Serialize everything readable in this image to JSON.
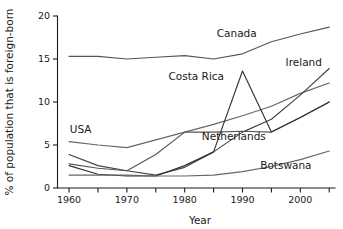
{
  "chart_data": {
    "type": "line",
    "title": "",
    "xlabel": "Year",
    "ylabel": "% of population that is foreign-born",
    "xlim": [
      1958,
      2006
    ],
    "ylim": [
      0,
      20
    ],
    "grid": false,
    "legend_position": "inline-labels",
    "x_ticks_labeled": [
      "1960",
      "1970",
      "1980",
      "1990",
      "2000"
    ],
    "x_tick_values_labeled": [
      1960,
      1970,
      1980,
      1990,
      2000
    ],
    "x_ticks_minor": [
      1965,
      1975,
      1985,
      1995,
      2005
    ],
    "y_ticks": [
      "0",
      "5",
      "10",
      "15",
      "20"
    ],
    "y_tick_values": [
      0,
      5,
      10,
      15,
      20
    ],
    "series": [
      {
        "name": "Canada",
        "label": "Canada",
        "color": "#555555",
        "x": [
          1960,
          1965,
          1970,
          1975,
          1980,
          1985,
          1990,
          1995,
          2000,
          2005
        ],
        "values": [
          15.3,
          15.3,
          15.0,
          15.2,
          15.4,
          15.0,
          15.6,
          17.0,
          17.9,
          18.7
        ]
      },
      {
        "name": "USA",
        "label": "USA",
        "color": "#666666",
        "x": [
          1960,
          1965,
          1970,
          1975,
          1980,
          1985,
          1990,
          1995,
          2000,
          2005
        ],
        "values": [
          5.4,
          5.0,
          4.7,
          5.6,
          6.5,
          7.4,
          8.4,
          9.5,
          11.0,
          12.2
        ]
      },
      {
        "name": "Ireland",
        "label": "Ireland",
        "color": "#444444",
        "x": [
          1960,
          1965,
          1970,
          1975,
          1980,
          1985,
          1990,
          1995,
          2000,
          2005
        ],
        "values": [
          3.9,
          2.6,
          2.0,
          1.5,
          2.4,
          4.2,
          6.5,
          8.0,
          10.8,
          13.9
        ]
      },
      {
        "name": "Netherlands",
        "label": "Netherlands",
        "color": "#555555",
        "x": [
          1960,
          1965,
          1970,
          1975,
          1980,
          1985,
          1990,
          1995,
          2000,
          2005
        ],
        "values": [
          2.8,
          2.3,
          2.0,
          3.9,
          6.5,
          6.5,
          6.6,
          6.5,
          8.2,
          10.0
        ]
      },
      {
        "name": "Costa Rica",
        "label": "Costa Rica",
        "color": "#333333",
        "x": [
          1960,
          1965,
          1970,
          1975,
          1980,
          1985,
          1990,
          1995,
          2000,
          2005
        ],
        "values": [
          2.6,
          1.6,
          1.4,
          1.4,
          2.6,
          4.2,
          13.6,
          6.5,
          8.2,
          10.0
        ]
      },
      {
        "name": "Botswana",
        "label": "Botswana",
        "color": "#666666",
        "x": [
          1960,
          1965,
          1970,
          1975,
          1980,
          1985,
          1990,
          1995,
          2000,
          2005
        ],
        "values": [
          1.5,
          1.5,
          1.5,
          1.4,
          1.4,
          1.5,
          1.9,
          2.5,
          3.3,
          4.3
        ]
      }
    ],
    "annotations": [
      {
        "text": "Canada",
        "x": 1989.0,
        "y": 17.6
      },
      {
        "text": "Ireland",
        "x": 2000.6,
        "y": 14.2
      },
      {
        "text": "Costa Rica",
        "x": 1982.0,
        "y": 12.6
      },
      {
        "text": "USA",
        "x": 1962.0,
        "y": 6.4
      },
      {
        "text": "Netherlands",
        "x": 1988.5,
        "y": 5.6
      },
      {
        "text": "Botswana",
        "x": 1997.5,
        "y": 2.2
      }
    ]
  }
}
